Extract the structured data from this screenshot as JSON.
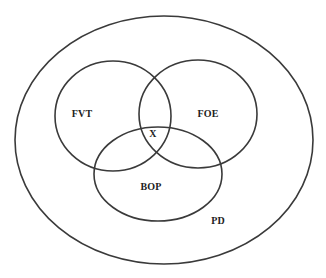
{
  "diagram": {
    "type": "venn",
    "stroke_color": "#3a3a3a",
    "text_color": "#222222",
    "outer": {
      "label": "PD",
      "shape": "ellipse",
      "cx": 164,
      "cy": 140,
      "rx": 149,
      "ry": 124,
      "label_x": 218,
      "label_y": 220
    },
    "sets": [
      {
        "id": "fvt",
        "label": "FVT",
        "cx": 113,
        "cy": 116,
        "rx": 58,
        "ry": 55,
        "label_x": 82,
        "label_y": 113
      },
      {
        "id": "foe",
        "label": "FOE",
        "cx": 198,
        "cy": 114,
        "rx": 59,
        "ry": 54,
        "label_x": 208,
        "label_y": 113
      },
      {
        "id": "bop",
        "label": "BOP",
        "cx": 158,
        "cy": 174,
        "rx": 64,
        "ry": 47,
        "label_x": 151,
        "label_y": 186
      }
    ],
    "intersection": {
      "label": "X",
      "x": 153,
      "y": 133
    }
  }
}
